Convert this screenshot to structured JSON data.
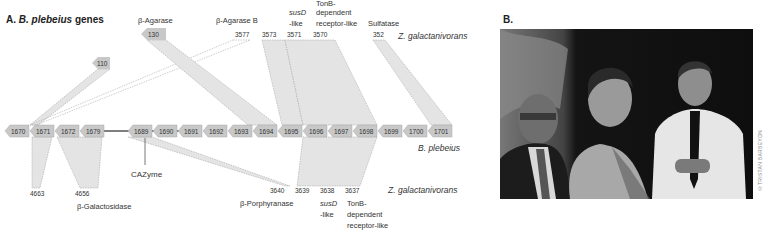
{
  "panel_a": {
    "label": "A.",
    "organism_title": "B. plebeius",
    "title_suffix": "genes",
    "reference_organism": "B. plebeius",
    "comparison_organism": "Z. galactanivorans",
    "reference_genes": [
      "1670",
      "1671",
      "1672",
      "1679",
      "1689",
      "1690",
      "1691",
      "1692",
      "1693",
      "1694",
      "1695",
      "1696",
      "1697",
      "1698",
      "1699",
      "1700",
      "1701"
    ],
    "top_genes": [
      {
        "id": "110",
        "annotation": "",
        "links_to": "1671"
      },
      {
        "id": "130",
        "annotation": "β-Agarase",
        "links_to": "1693-1694"
      },
      {
        "id": "3577",
        "annotation": "β-Agarase B",
        "links_to": "1671"
      },
      {
        "id": "3573",
        "annotation": "",
        "links_to": "1695"
      },
      {
        "id": "3571",
        "annotation": "susD -like",
        "links_to": "1696"
      },
      {
        "id": "3570",
        "annotation": "TonB-dependent receptor-like",
        "links_to": "1697-1698"
      },
      {
        "id": "352",
        "annotation": "Sulfatase",
        "links_to": "1701"
      }
    ],
    "top_annotations": {
      "agarase": "β-Agarase",
      "agarase_b": "β-Agarase B",
      "susd_italic": "susD",
      "susd_suffix": "-like",
      "tonb_1": "TonB-",
      "tonb_2": "dependent",
      "tonb_3": "receptor-like",
      "sulfatase": "Sulfatase"
    },
    "bottom_genes": [
      {
        "id": "4663",
        "annotation": "",
        "links_to": "1671"
      },
      {
        "id": "4656",
        "annotation": "β-Galactosidase",
        "links_to": "1672-1679"
      },
      {
        "id": "3640",
        "annotation": "β-Porphyranase",
        "links_to": "1689"
      },
      {
        "id": "3639",
        "annotation": "",
        "links_to": "1696"
      },
      {
        "id": "3638",
        "annotation": "susD -like",
        "links_to": "1697"
      },
      {
        "id": "3637",
        "annotation": "TonB-dependent receptor-like",
        "links_to": "1698"
      }
    ],
    "bottom_annotations": {
      "galactosidase": "β-Galactosidase",
      "porphyranase": "β-Porphyranase",
      "susd_italic": "susD",
      "susd_suffix": "-like",
      "tonb_1": "TonB-",
      "tonb_2": "dependent",
      "tonb_3": "receptor-like"
    },
    "cazyme_label": "CAZyme",
    "colors": {
      "gene_fill": "#c8c8c8",
      "gene_stroke": "#a8a8a8",
      "link_fill": "#e4e4e4",
      "link_stroke": "#9a9a9a",
      "cazyme_line": "#555555"
    }
  },
  "panel_b": {
    "label": "B.",
    "photo_description": "Three people posing in front of a dark curtain",
    "credit": "©TRISTAN BARBEYON"
  }
}
